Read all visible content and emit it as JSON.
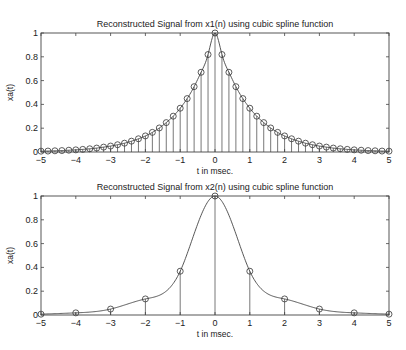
{
  "chart_data": [
    {
      "type": "stem+line",
      "title": "Reconstructed Signal from x1(n) using cubic spline function",
      "xlabel": "t in msec.",
      "ylabel": "xa(t)",
      "xlim": [
        -5,
        5
      ],
      "ylim": [
        0,
        1
      ],
      "xticks": [
        -5,
        -4,
        -3,
        -2,
        -1,
        0,
        1,
        2,
        3,
        4,
        5
      ],
      "yticks": [
        0,
        0.2,
        0.4,
        0.6,
        0.8,
        1
      ],
      "ytick_labels": [
        "0",
        "0.2",
        "0.4",
        "0.6",
        "0.8",
        "1"
      ],
      "grid": false,
      "sample_period_ms": 0.2,
      "samples_formula": "x(n) = exp(-|t|), t in msec",
      "x": [
        -5,
        -4.8,
        -4.6,
        -4.4,
        -4.2,
        -4,
        -3.8,
        -3.6,
        -3.4,
        -3.2,
        -3,
        -2.8,
        -2.6,
        -2.4,
        -2.2,
        -2,
        -1.8,
        -1.6,
        -1.4,
        -1.2,
        -1,
        -0.8,
        -0.6,
        -0.4,
        -0.2,
        0,
        0.2,
        0.4,
        0.6,
        0.8,
        1,
        1.2,
        1.4,
        1.6,
        1.8,
        2,
        2.2,
        2.4,
        2.6,
        2.8,
        3,
        3.2,
        3.4,
        3.6,
        3.8,
        4,
        4.2,
        4.4,
        4.6,
        4.8,
        5
      ],
      "values": [
        0.007,
        0.008,
        0.01,
        0.012,
        0.015,
        0.018,
        0.022,
        0.027,
        0.033,
        0.041,
        0.05,
        0.061,
        0.074,
        0.091,
        0.111,
        0.135,
        0.165,
        0.202,
        0.247,
        0.301,
        0.368,
        0.449,
        0.549,
        0.67,
        0.819,
        1.0,
        0.819,
        0.67,
        0.549,
        0.449,
        0.368,
        0.301,
        0.247,
        0.202,
        0.165,
        0.135,
        0.111,
        0.091,
        0.074,
        0.061,
        0.05,
        0.041,
        0.033,
        0.027,
        0.022,
        0.018,
        0.015,
        0.012,
        0.01,
        0.008,
        0.007
      ]
    },
    {
      "type": "stem+line",
      "title": "Reconstructed Signal from x2(n) using cubic spline function",
      "xlabel": "t in msec.",
      "ylabel": "xa(t)",
      "xlim": [
        -5,
        5
      ],
      "ylim": [
        0,
        1
      ],
      "xticks": [
        -5,
        -4,
        -3,
        -2,
        -1,
        0,
        1,
        2,
        3,
        4,
        5
      ],
      "yticks": [
        0,
        0.2,
        0.4,
        0.6,
        0.8,
        1
      ],
      "ytick_labels": [
        "0",
        "0.2",
        "0.4",
        "0.6",
        "0.8",
        "1"
      ],
      "grid": false,
      "sample_period_ms": 1,
      "x": [
        -5,
        -4,
        -3,
        -2,
        -1,
        0,
        1,
        2,
        3,
        4,
        5
      ],
      "values": [
        0.007,
        0.018,
        0.05,
        0.135,
        0.368,
        1.0,
        0.368,
        0.135,
        0.05,
        0.018,
        0.007
      ]
    }
  ],
  "xtick_labels": [
    "−5",
    "−4",
    "−3",
    "−2",
    "−1",
    "0",
    "1",
    "2",
    "3",
    "4",
    "5"
  ]
}
